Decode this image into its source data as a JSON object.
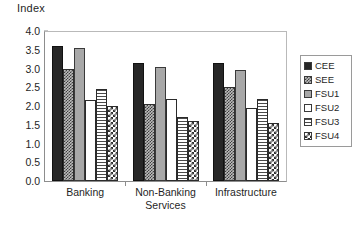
{
  "chart_data": {
    "type": "bar",
    "title": "",
    "xlabel": "",
    "ylabel": "Index",
    "ylim": [
      0,
      4.0
    ],
    "ytick_step": 0.5,
    "grid": false,
    "legend_position": "right",
    "yticks": [
      "4.0",
      "3.5",
      "3.0",
      "2.5",
      "2.0",
      "1.5",
      "1.0",
      "0.5",
      "0.0"
    ],
    "ytick_values": [
      4.0,
      3.5,
      3.0,
      2.5,
      2.0,
      1.5,
      1.0,
      0.5,
      0.0
    ],
    "categories": [
      "Banking",
      "Non-Banking Services",
      "Infrastructure"
    ],
    "category_lines": [
      [
        "Banking"
      ],
      [
        "Non-Banking",
        "Services"
      ],
      [
        "Infrastructure"
      ]
    ],
    "series": [
      {
        "name": "CEE",
        "pattern": "solid-black",
        "values": [
          3.6,
          3.15,
          3.15
        ]
      },
      {
        "name": "SEE",
        "pattern": "dark-crosshatch",
        "values": [
          3.0,
          2.05,
          2.5
        ]
      },
      {
        "name": "FSU1",
        "pattern": "solid-gray",
        "values": [
          3.55,
          3.05,
          2.95
        ]
      },
      {
        "name": "FSU2",
        "pattern": "white-empty",
        "values": [
          2.15,
          2.2,
          1.95
        ]
      },
      {
        "name": "FSU3",
        "pattern": "horizontal-lines",
        "values": [
          2.45,
          1.7,
          2.2
        ]
      },
      {
        "name": "FSU4",
        "pattern": "checkerboard",
        "values": [
          2.0,
          1.6,
          1.55
        ]
      }
    ],
    "colors": {
      "cee": "#272727",
      "see": "#bdbdbd",
      "fsu1": "#a8a8a8",
      "fsu2": "#ffffff",
      "fsu3": "#ffffff",
      "fsu4": "#ffffff",
      "axis": "#8d8d8d",
      "text": "#1f1f1f",
      "background": "#ffffff"
    }
  }
}
